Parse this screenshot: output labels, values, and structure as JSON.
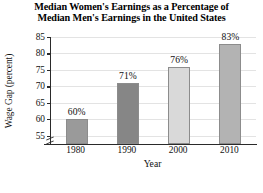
{
  "chart_data": {
    "type": "bar",
    "title": "Median Women's Earnings as a Percentage of Median Men's Earnings in the United States",
    "title_lines": [
      "Median Women's Earnings as a Percentage of",
      "Median Men's Earnings in the United States"
    ],
    "xlabel": "Year",
    "ylabel": "Wage Gap (percent)",
    "categories": [
      "1980",
      "1990",
      "2000",
      "2010"
    ],
    "values": [
      60,
      71,
      76,
      83
    ],
    "value_labels": [
      "60%",
      "71%",
      "76%",
      "83%"
    ],
    "bar_colors": [
      "#9a9a9a",
      "#868686",
      "#d9d9d9",
      "#b3b3b3"
    ],
    "bar_edge_color": "#8c8c8c",
    "ylim": [
      52.5,
      85
    ],
    "yticks": [
      55,
      60,
      65,
      70,
      75,
      80,
      85
    ],
    "ytick_labels": [
      "55",
      "60",
      "65",
      "70",
      "75",
      "80",
      "85"
    ],
    "grid": true,
    "grid_axis": "y",
    "grid_color": "#e3e3e3",
    "legend": false,
    "axis_break": true,
    "axis_break_note": "y-axis broken below 55",
    "background_color": "#ffffff",
    "axis_color": "#2a2a2a"
  }
}
